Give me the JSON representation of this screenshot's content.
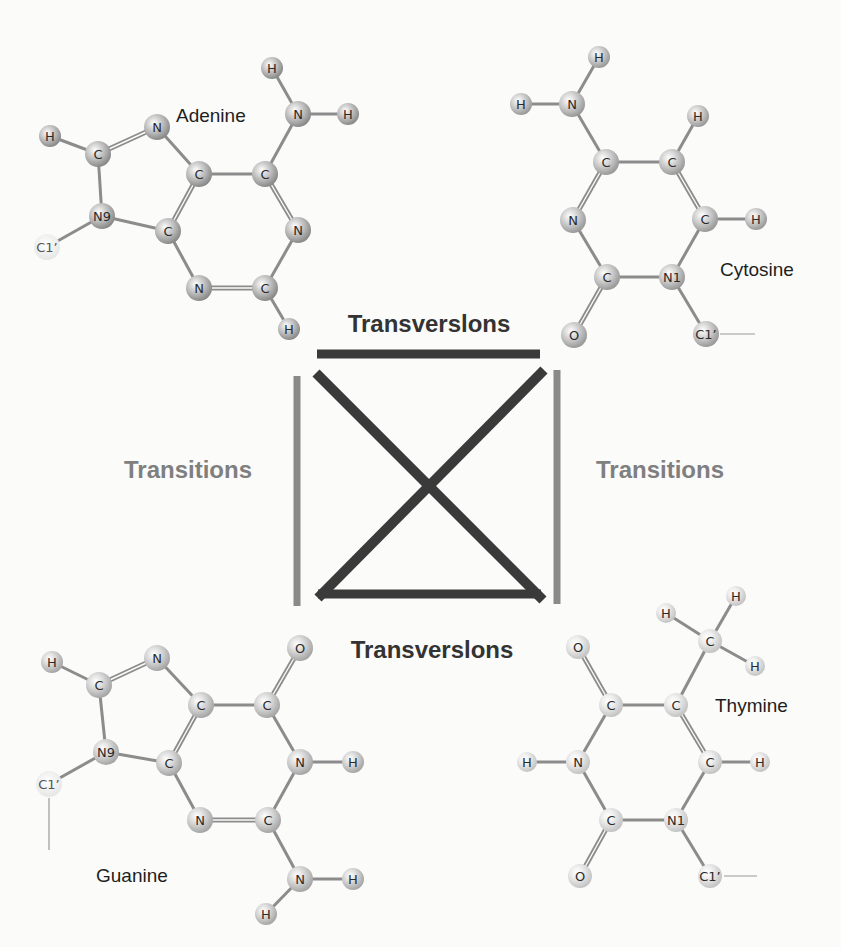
{
  "diagram": {
    "colors": {
      "background": "#fbfbfa",
      "transversion": "#3a3a3a",
      "transition": "#8a8a8a",
      "bond": "#8c8c8c",
      "molecule_label": "#1e1e1e",
      "transversion_label": "#333333",
      "transition_label": "#7f7f7f"
    },
    "labels": {
      "transversion_top": {
        "text": "Transverslons",
        "x": 429,
        "y": 332
      },
      "transversion_bottom": {
        "text": "Transverslons",
        "x": 432,
        "y": 658
      },
      "transition_left": {
        "text": "Transitions",
        "x": 188,
        "y": 478
      },
      "transition_right": {
        "text": "Transitions",
        "x": 660,
        "y": 478
      }
    },
    "bars": {
      "transversion_top": {
        "x1": 317,
        "y1": 354,
        "x2": 540,
        "y2": 354,
        "width": 9
      },
      "transversion_bottom": {
        "x1": 318,
        "y1": 594,
        "x2": 541,
        "y2": 594,
        "width": 9
      },
      "transition_left": {
        "x1": 297,
        "y1": 376,
        "x2": 297,
        "y2": 606,
        "width": 7
      },
      "transition_right": {
        "x1": 557,
        "y1": 370,
        "x2": 557,
        "y2": 604,
        "width": 7
      },
      "diagonal_1": {
        "x1": 316,
        "y1": 373,
        "x2": 543,
        "y2": 600,
        "width": 10
      },
      "diagonal_2": {
        "x1": 544,
        "y1": 370,
        "x2": 318,
        "y2": 598,
        "width": 10
      }
    },
    "molecules": [
      {
        "id": "adenine",
        "name": "Adenine",
        "name_pos": {
          "x": 176,
          "y": 122
        },
        "sphere": {
          "light": "#d4d4d4",
          "dark": "#8a8a8a",
          "text": "#2a2a2a"
        },
        "atoms": [
          {
            "id": "H8",
            "el": "H",
            "x": 50,
            "y": 136,
            "r": 11
          },
          {
            "id": "C8",
            "el": "C",
            "x": 98,
            "y": 154,
            "r": 13
          },
          {
            "id": "N7",
            "el": "N",
            "x": 157,
            "y": 127,
            "r": 13
          },
          {
            "id": "N9",
            "el": "N9",
            "x": 102,
            "y": 216,
            "r": 13
          },
          {
            "id": "C1p",
            "el": "C1’",
            "x": 47,
            "y": 247,
            "r": 13,
            "ghost": true
          },
          {
            "id": "C5",
            "el": "C",
            "x": 199,
            "y": 174,
            "r": 13
          },
          {
            "id": "C4",
            "el": "C",
            "x": 168,
            "y": 231,
            "r": 13
          },
          {
            "id": "C6",
            "el": "C",
            "x": 265,
            "y": 174,
            "r": 13
          },
          {
            "id": "N6",
            "el": "N",
            "x": 298,
            "y": 114,
            "r": 13
          },
          {
            "id": "H6a",
            "el": "H",
            "x": 272,
            "y": 68,
            "r": 11
          },
          {
            "id": "H6b",
            "el": "H",
            "x": 348,
            "y": 114,
            "r": 11
          },
          {
            "id": "N1",
            "el": "N",
            "x": 298,
            "y": 230,
            "r": 13
          },
          {
            "id": "C2",
            "el": "C",
            "x": 265,
            "y": 288,
            "r": 13
          },
          {
            "id": "N3",
            "el": "N",
            "x": 199,
            "y": 288,
            "r": 13
          },
          {
            "id": "H2",
            "el": "H",
            "x": 289,
            "y": 329,
            "r": 11
          }
        ],
        "bonds": [
          [
            "H8",
            "C8",
            1
          ],
          [
            "C8",
            "N7",
            2
          ],
          [
            "C8",
            "N9",
            1
          ],
          [
            "N9",
            "C1p",
            1
          ],
          [
            "N9",
            "C4",
            1
          ],
          [
            "N7",
            "C5",
            1
          ],
          [
            "C5",
            "C4",
            2
          ],
          [
            "C5",
            "C6",
            1
          ],
          [
            "C6",
            "N6",
            1
          ],
          [
            "N6",
            "H6a",
            1
          ],
          [
            "N6",
            "H6b",
            1
          ],
          [
            "C6",
            "N1",
            2
          ],
          [
            "N1",
            "C2",
            1
          ],
          [
            "C2",
            "N3",
            2
          ],
          [
            "N3",
            "C4",
            1
          ],
          [
            "C2",
            "H2",
            1
          ]
        ]
      },
      {
        "id": "cytosine",
        "name": "Cytosine",
        "name_pos": {
          "x": 720,
          "y": 276
        },
        "sphere": {
          "light": "#dcdcdc",
          "dark": "#9a9a9a",
          "text": "#2a2a2a"
        },
        "atoms": [
          {
            "id": "H4a",
            "el": "H",
            "x": 599,
            "y": 57,
            "r": 11
          },
          {
            "id": "N4",
            "el": "N",
            "x": 572,
            "y": 104,
            "r": 13
          },
          {
            "id": "H4b",
            "el": "H",
            "x": 521,
            "y": 104,
            "r": 11
          },
          {
            "id": "C4",
            "el": "C",
            "x": 606,
            "y": 162,
            "r": 13
          },
          {
            "id": "C5",
            "el": "C",
            "x": 672,
            "y": 162,
            "r": 13
          },
          {
            "id": "H5",
            "el": "H",
            "x": 698,
            "y": 116,
            "r": 11
          },
          {
            "id": "N3",
            "el": "N",
            "x": 573,
            "y": 220,
            "r": 13
          },
          {
            "id": "C6",
            "el": "C",
            "x": 705,
            "y": 219,
            "r": 13
          },
          {
            "id": "H6",
            "el": "H",
            "x": 756,
            "y": 219,
            "r": 11
          },
          {
            "id": "C2",
            "el": "C",
            "x": 607,
            "y": 277,
            "r": 13
          },
          {
            "id": "N1",
            "el": "N1",
            "x": 672,
            "y": 277,
            "r": 13
          },
          {
            "id": "O2",
            "el": "O",
            "x": 574,
            "y": 335,
            "r": 13
          },
          {
            "id": "C1p",
            "el": "C1’",
            "x": 706,
            "y": 334,
            "r": 13
          }
        ],
        "bonds": [
          [
            "H4a",
            "N4",
            1
          ],
          [
            "H4b",
            "N4",
            1
          ],
          [
            "N4",
            "C4",
            1
          ],
          [
            "C4",
            "C5",
            1
          ],
          [
            "C5",
            "H5",
            1
          ],
          [
            "C4",
            "N3",
            2
          ],
          [
            "C5",
            "C6",
            2
          ],
          [
            "C6",
            "H6",
            1
          ],
          [
            "N3",
            "C2",
            1
          ],
          [
            "C6",
            "N1",
            1
          ],
          [
            "C2",
            "N1",
            1
          ],
          [
            "C2",
            "O2",
            2
          ],
          [
            "N1",
            "C1p",
            1
          ]
        ],
        "tail": {
          "x1": 720,
          "y1": 334,
          "x2": 755,
          "y2": 334
        }
      },
      {
        "id": "guanine",
        "name": "Guanine",
        "name_pos": {
          "x": 96,
          "y": 882
        },
        "sphere": {
          "light": "#e2e2e2",
          "dark": "#a6a6a6",
          "text": "#2a2a2a"
        },
        "atoms": [
          {
            "id": "H8",
            "el": "H",
            "x": 52,
            "y": 662,
            "r": 11
          },
          {
            "id": "C8",
            "el": "C",
            "x": 99,
            "y": 685,
            "r": 13
          },
          {
            "id": "N7",
            "el": "N",
            "x": 157,
            "y": 658,
            "r": 13
          },
          {
            "id": "N9",
            "el": "N9",
            "x": 106,
            "y": 752,
            "r": 13
          },
          {
            "id": "C1p",
            "el": "C1’",
            "x": 49,
            "y": 784,
            "r": 13,
            "ghost": true
          },
          {
            "id": "C5",
            "el": "C",
            "x": 201,
            "y": 705,
            "r": 13
          },
          {
            "id": "C4",
            "el": "C",
            "x": 169,
            "y": 763,
            "r": 13
          },
          {
            "id": "C6",
            "el": "C",
            "x": 267,
            "y": 705,
            "r": 13
          },
          {
            "id": "O6",
            "el": "O",
            "x": 300,
            "y": 648,
            "r": 13
          },
          {
            "id": "N1",
            "el": "N",
            "x": 300,
            "y": 762,
            "r": 13
          },
          {
            "id": "H1",
            "el": "H",
            "x": 353,
            "y": 762,
            "r": 11
          },
          {
            "id": "C2",
            "el": "C",
            "x": 268,
            "y": 820,
            "r": 13
          },
          {
            "id": "N3",
            "el": "N",
            "x": 200,
            "y": 820,
            "r": 13
          },
          {
            "id": "N2",
            "el": "N",
            "x": 300,
            "y": 879,
            "r": 13
          },
          {
            "id": "H2a",
            "el": "H",
            "x": 353,
            "y": 879,
            "r": 11
          },
          {
            "id": "H2b",
            "el": "H",
            "x": 266,
            "y": 914,
            "r": 11
          }
        ],
        "bonds": [
          [
            "H8",
            "C8",
            1
          ],
          [
            "C8",
            "N7",
            2
          ],
          [
            "C8",
            "N9",
            1
          ],
          [
            "N9",
            "C1p",
            1
          ],
          [
            "N9",
            "C4",
            1
          ],
          [
            "N7",
            "C5",
            1
          ],
          [
            "C5",
            "C4",
            2
          ],
          [
            "C5",
            "C6",
            1
          ],
          [
            "C6",
            "O6",
            2
          ],
          [
            "C6",
            "N1",
            1
          ],
          [
            "N1",
            "H1",
            1
          ],
          [
            "N1",
            "C2",
            1
          ],
          [
            "C2",
            "N3",
            2
          ],
          [
            "N3",
            "C4",
            1
          ],
          [
            "C2",
            "N2",
            1
          ],
          [
            "N2",
            "H2a",
            1
          ],
          [
            "N2",
            "H2b",
            1
          ]
        ],
        "tail": {
          "x1": 49,
          "y1": 798,
          "x2": 49,
          "y2": 850
        }
      },
      {
        "id": "thymine",
        "name": "Thymine",
        "name_pos": {
          "x": 715,
          "y": 712
        },
        "sphere": {
          "light": "#f0f0f0",
          "dark": "#c4c4c4",
          "text": "#2a2a2a"
        },
        "atoms": [
          {
            "id": "H7a",
            "el": "H",
            "x": 736,
            "y": 596,
            "r": 10
          },
          {
            "id": "H7b",
            "el": "H",
            "x": 666,
            "y": 613,
            "r": 10
          },
          {
            "id": "C7",
            "el": "C",
            "x": 710,
            "y": 641,
            "r": 12
          },
          {
            "id": "H7c",
            "el": "H",
            "x": 755,
            "y": 666,
            "r": 10
          },
          {
            "id": "O4",
            "el": "O",
            "x": 578,
            "y": 647,
            "r": 12
          },
          {
            "id": "C4",
            "el": "C",
            "x": 611,
            "y": 705,
            "r": 12
          },
          {
            "id": "C5",
            "el": "C",
            "x": 676,
            "y": 705,
            "r": 12
          },
          {
            "id": "N3",
            "el": "N",
            "x": 578,
            "y": 762,
            "r": 12
          },
          {
            "id": "H3",
            "el": "H",
            "x": 527,
            "y": 762,
            "r": 10
          },
          {
            "id": "C6",
            "el": "C",
            "x": 710,
            "y": 762,
            "r": 12
          },
          {
            "id": "H6",
            "el": "H",
            "x": 760,
            "y": 762,
            "r": 10
          },
          {
            "id": "C2",
            "el": "C",
            "x": 611,
            "y": 820,
            "r": 12
          },
          {
            "id": "N1",
            "el": "N1",
            "x": 676,
            "y": 820,
            "r": 12
          },
          {
            "id": "O2",
            "el": "O",
            "x": 580,
            "y": 876,
            "r": 12
          },
          {
            "id": "C1p",
            "el": "C1’",
            "x": 710,
            "y": 876,
            "r": 12
          }
        ],
        "bonds": [
          [
            "H7a",
            "C7",
            1
          ],
          [
            "H7b",
            "C7",
            1
          ],
          [
            "C7",
            "H7c",
            1
          ],
          [
            "C7",
            "C5",
            1
          ],
          [
            "O4",
            "C4",
            2
          ],
          [
            "C4",
            "C5",
            1
          ],
          [
            "C4",
            "N3",
            1
          ],
          [
            "N3",
            "H3",
            1
          ],
          [
            "C5",
            "C6",
            2
          ],
          [
            "C6",
            "H6",
            1
          ],
          [
            "N3",
            "C2",
            1
          ],
          [
            "C6",
            "N1",
            1
          ],
          [
            "C2",
            "N1",
            1
          ],
          [
            "C2",
            "O2",
            2
          ],
          [
            "N1",
            "C1p",
            1
          ]
        ],
        "tail": {
          "x1": 724,
          "y1": 876,
          "x2": 757,
          "y2": 876
        }
      }
    ]
  }
}
